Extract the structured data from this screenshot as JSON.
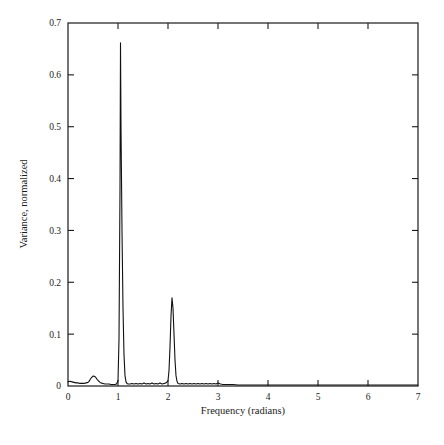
{
  "chart_data": {
    "type": "line",
    "title": "",
    "subtitle": "",
    "xlabel": "Frequency (radians)",
    "ylabel": "Variance, normalized",
    "xlim": [
      0,
      7
    ],
    "ylim": [
      0,
      0.7
    ],
    "xticks": [
      0,
      1,
      2,
      3,
      4,
      5,
      6,
      7
    ],
    "xtick_labels": [
      "0",
      "1",
      "2",
      "3",
      "4",
      "5",
      "6",
      "7"
    ],
    "yticks": [
      0,
      0.1,
      0.2,
      0.3,
      0.4,
      0.5,
      0.6,
      0.7
    ],
    "ytick_labels": [
      "0",
      "0.1",
      "0.2",
      "0.3",
      "0.4",
      "0.5",
      "0.6",
      "0.7"
    ],
    "grid": false,
    "legend": "none",
    "tick_direction": "in",
    "frame": "box",
    "line_color": "#111111",
    "line_width": 1.1,
    "background": "#ffffff",
    "annotations": [
      {
        "label": "primary peak",
        "x": 1.05,
        "y": 0.662
      },
      {
        "label": "secondary peak",
        "x": 2.08,
        "y": 0.17
      },
      {
        "label": "low-frequency shoulder",
        "x": 0.52,
        "y": 0.019
      }
    ],
    "series": [
      {
        "name": "normalized variance spectrum",
        "x": [
          0.0,
          0.04,
          0.08,
          0.12,
          0.16,
          0.2,
          0.24,
          0.28,
          0.32,
          0.36,
          0.4,
          0.42,
          0.44,
          0.46,
          0.48,
          0.5,
          0.52,
          0.54,
          0.56,
          0.58,
          0.6,
          0.62,
          0.64,
          0.66,
          0.7,
          0.74,
          0.78,
          0.82,
          0.86,
          0.9,
          0.94,
          0.97,
          1.0,
          1.02,
          1.04,
          1.05,
          1.06,
          1.08,
          1.1,
          1.12,
          1.14,
          1.16,
          1.18,
          1.2,
          1.24,
          1.28,
          1.32,
          1.36,
          1.4,
          1.44,
          1.48,
          1.52,
          1.56,
          1.6,
          1.64,
          1.68,
          1.72,
          1.76,
          1.8,
          1.84,
          1.88,
          1.92,
          1.96,
          2.0,
          2.02,
          2.04,
          2.06,
          2.08,
          2.1,
          2.12,
          2.14,
          2.16,
          2.18,
          2.2,
          2.24,
          2.28,
          2.32,
          2.36,
          2.4,
          2.44,
          2.48,
          2.52,
          2.56,
          2.6,
          2.64,
          2.68,
          2.72,
          2.76,
          2.8,
          2.84,
          2.88,
          2.92,
          2.96,
          3.0,
          3.05,
          3.1,
          3.2,
          3.3,
          3.4,
          3.5,
          3.6,
          3.8,
          4.0,
          4.2,
          4.4,
          4.6,
          4.8,
          5.0,
          5.2,
          5.4,
          5.6,
          5.8,
          6.0,
          6.2,
          6.4,
          6.6,
          6.8,
          7.0
        ],
        "y": [
          0.008,
          0.009,
          0.008,
          0.007,
          0.006,
          0.006,
          0.005,
          0.005,
          0.005,
          0.006,
          0.007,
          0.009,
          0.012,
          0.015,
          0.017,
          0.019,
          0.019,
          0.018,
          0.016,
          0.013,
          0.011,
          0.009,
          0.007,
          0.006,
          0.005,
          0.004,
          0.004,
          0.004,
          0.003,
          0.003,
          0.003,
          0.004,
          0.01,
          0.09,
          0.38,
          0.662,
          0.5,
          0.3,
          0.15,
          0.06,
          0.02,
          0.008,
          0.005,
          0.004,
          0.004,
          0.005,
          0.004,
          0.005,
          0.004,
          0.005,
          0.004,
          0.006,
          0.004,
          0.005,
          0.004,
          0.006,
          0.004,
          0.005,
          0.004,
          0.006,
          0.004,
          0.005,
          0.006,
          0.01,
          0.03,
          0.075,
          0.135,
          0.17,
          0.15,
          0.1,
          0.05,
          0.02,
          0.009,
          0.005,
          0.004,
          0.005,
          0.004,
          0.005,
          0.004,
          0.005,
          0.004,
          0.005,
          0.004,
          0.005,
          0.004,
          0.005,
          0.004,
          0.005,
          0.004,
          0.005,
          0.004,
          0.005,
          0.004,
          0.006,
          0.004,
          0.003,
          0.003,
          0.003,
          0.002,
          0.002,
          0.002,
          0.002,
          0.002,
          0.002,
          0.002,
          0.002,
          0.002,
          0.002,
          0.002,
          0.002,
          0.002,
          0.002,
          0.002,
          0.002,
          0.002,
          0.002,
          0.002,
          0.002
        ]
      }
    ]
  }
}
